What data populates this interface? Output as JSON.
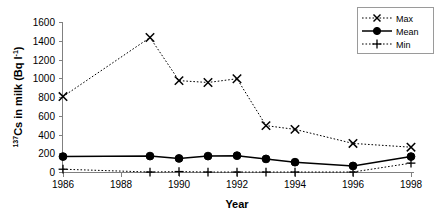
{
  "chart_data": {
    "type": "line",
    "title": "",
    "xlabel": "Year",
    "ylabel": "137Cs in milk (Bq l-1)",
    "ylabel_parts": {
      "sup_pre": "137",
      "main": "Cs in milk (Bq l",
      "sup_post": "-1",
      "tail": ")"
    },
    "x": [
      1986,
      1989,
      1990,
      1991,
      1992,
      1993,
      1994,
      1996,
      1998
    ],
    "xlim": [
      1986,
      1998
    ],
    "ylim": [
      0,
      1600
    ],
    "xticks": [
      1986,
      1988,
      1990,
      1992,
      1994,
      1996,
      1998
    ],
    "xtick_labels": [
      "1986",
      "1988",
      "1990",
      "1992",
      "1994",
      "1996",
      "1998"
    ],
    "yticks": [
      0,
      200,
      400,
      600,
      800,
      1000,
      1200,
      1400,
      1600
    ],
    "ytick_labels": [
      "0",
      "200",
      "400",
      "600",
      "800",
      "1000",
      "1200",
      "1400",
      "1600"
    ],
    "grid": false,
    "legend_position": "top-right",
    "series": [
      {
        "name": "Max",
        "marker": "x",
        "line_style": "dotted",
        "color": "#000000",
        "values": [
          810,
          1440,
          980,
          960,
          1000,
          500,
          460,
          310,
          270
        ]
      },
      {
        "name": "Mean",
        "marker": "circle",
        "line_style": "solid",
        "color": "#000000",
        "values": [
          170,
          175,
          150,
          175,
          180,
          145,
          110,
          70,
          170
        ]
      },
      {
        "name": "Min",
        "marker": "plus",
        "line_style": "dotted",
        "color": "#000000",
        "values": [
          35,
          5,
          10,
          5,
          5,
          5,
          5,
          5,
          100
        ]
      }
    ]
  },
  "legend": {
    "items": [
      {
        "label": "Max"
      },
      {
        "label": "Mean"
      },
      {
        "label": "Min"
      }
    ]
  },
  "axes": {
    "x_title": "Year"
  }
}
